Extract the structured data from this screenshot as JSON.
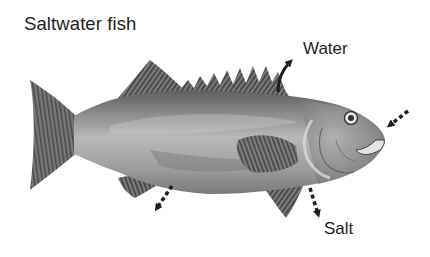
{
  "diagram": {
    "title": "Saltwater fish",
    "labels": {
      "water": "Water",
      "salt": "Salt"
    },
    "flows": [
      {
        "name": "water-out",
        "label": "Water",
        "direction": "out of body (through top/skin)",
        "style": "solid"
      },
      {
        "name": "water-in-mouth",
        "label": "",
        "direction": "into mouth",
        "style": "dashed"
      },
      {
        "name": "salt-out-gills",
        "label": "Salt",
        "direction": "out of body (below gills)",
        "style": "dashed"
      },
      {
        "name": "salt-out-vent",
        "label": "",
        "direction": "out of body (vent)",
        "style": "dashed"
      }
    ],
    "colors": {
      "ink": "#1e1e1e",
      "body_light": "#b5b5b5",
      "body_mid": "#8f8f8f",
      "body_dark": "#555555",
      "fin": "#5a5a5a",
      "background": "#ffffff"
    }
  }
}
